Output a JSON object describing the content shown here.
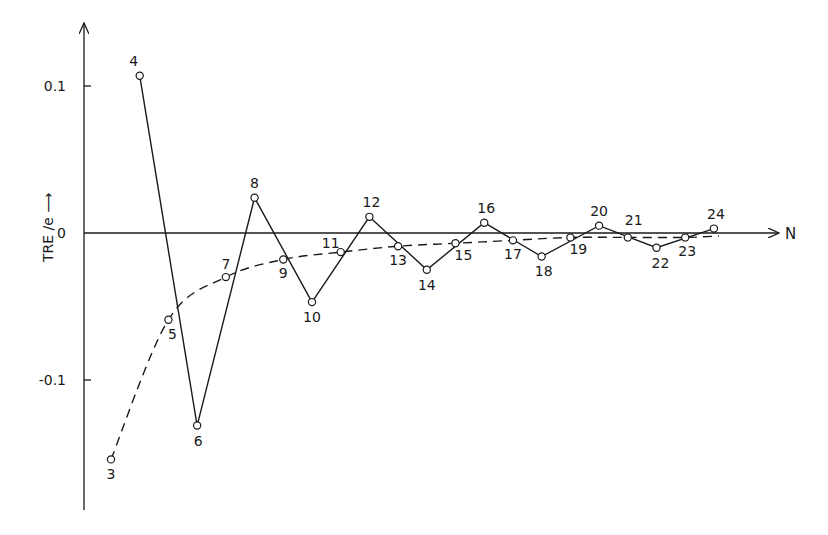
{
  "chart_data": {
    "type": "line",
    "title": "",
    "xlabel": "N",
    "ylabel": "TRE /e",
    "ylim": [
      -0.19,
      0.13
    ],
    "xlim": [
      1.5,
      25.5
    ],
    "grid": false,
    "legend": null,
    "yticks": [
      {
        "value": 0.1,
        "label": "0.1"
      },
      {
        "value": 0,
        "label": "0"
      },
      {
        "value": -0.1,
        "label": "-0.1"
      }
    ],
    "points": [
      {
        "n": 3,
        "value": -0.154
      },
      {
        "n": 4,
        "value": 0.107
      },
      {
        "n": 5,
        "value": -0.059
      },
      {
        "n": 6,
        "value": -0.131
      },
      {
        "n": 7,
        "value": -0.03
      },
      {
        "n": 8,
        "value": 0.024
      },
      {
        "n": 9,
        "value": -0.018
      },
      {
        "n": 10,
        "value": -0.047
      },
      {
        "n": 11,
        "value": -0.013
      },
      {
        "n": 12,
        "value": 0.011
      },
      {
        "n": 13,
        "value": -0.009
      },
      {
        "n": 14,
        "value": -0.025
      },
      {
        "n": 15,
        "value": -0.007
      },
      {
        "n": 16,
        "value": 0.007
      },
      {
        "n": 17,
        "value": -0.005
      },
      {
        "n": 18,
        "value": -0.016
      },
      {
        "n": 19,
        "value": -0.003
      },
      {
        "n": 20,
        "value": 0.005
      },
      {
        "n": 21,
        "value": -0.003
      },
      {
        "n": 22,
        "value": -0.01
      },
      {
        "n": 23,
        "value": -0.003
      },
      {
        "n": 24,
        "value": 0.003
      }
    ],
    "series": [
      {
        "name": "solid zigzag (even N)",
        "style": "solid",
        "x": [
          4,
          6,
          8,
          10,
          12,
          14,
          16,
          18,
          20,
          22,
          24
        ],
        "values": [
          0.107,
          -0.131,
          0.024,
          -0.047,
          0.011,
          -0.025,
          0.007,
          -0.016,
          0.005,
          -0.01,
          0.003
        ]
      },
      {
        "name": "dashed curve (odd N)",
        "style": "dashed",
        "x": [
          3,
          5,
          7,
          9,
          11,
          13,
          15,
          17,
          19,
          21,
          23
        ],
        "values": [
          -0.154,
          -0.059,
          -0.03,
          -0.018,
          -0.013,
          -0.009,
          -0.007,
          -0.005,
          -0.003,
          -0.003,
          -0.003
        ]
      }
    ],
    "label_offsets": {
      "3": [
        0,
        20
      ],
      "4": [
        -6,
        -10
      ],
      "5": [
        4,
        19
      ],
      "6": [
        1,
        20
      ],
      "7": [
        0,
        -8
      ],
      "8": [
        0,
        -10
      ],
      "9": [
        0,
        19
      ],
      "10": [
        0,
        20
      ],
      "11": [
        -10,
        -4
      ],
      "12": [
        2,
        -10
      ],
      "13": [
        0,
        19
      ],
      "14": [
        0,
        20
      ],
      "15": [
        8,
        17
      ],
      "16": [
        2,
        -10
      ],
      "17": [
        0,
        19
      ],
      "18": [
        2,
        19
      ],
      "19": [
        8,
        17
      ],
      "20": [
        0,
        -10
      ],
      "21": [
        6,
        -12
      ],
      "22": [
        4,
        20
      ],
      "23": [
        2,
        19
      ],
      "24": [
        2,
        -10
      ]
    }
  }
}
